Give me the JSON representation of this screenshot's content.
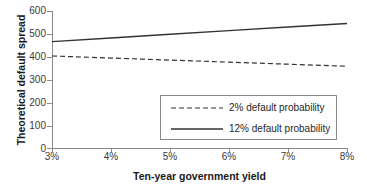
{
  "chart_data": {
    "type": "line",
    "title": "",
    "xlabel": "Ten-year government yield",
    "ylabel": "Theoretical default spread",
    "x": [
      3,
      4,
      5,
      6,
      7,
      8
    ],
    "xticklabels": [
      "3%",
      "4%",
      "5%",
      "6%",
      "7%",
      "8%"
    ],
    "yticklabels": [
      "0",
      "100",
      "200",
      "300",
      "400",
      "500",
      "600"
    ],
    "yticks": [
      0,
      100,
      200,
      300,
      400,
      500,
      600
    ],
    "xlim": [
      3,
      8
    ],
    "ylim": [
      0,
      600
    ],
    "grid": false,
    "legend_position": "center-right-inside",
    "series": [
      {
        "name": "2% default probability",
        "style": "dashed",
        "color": "#333333",
        "values": [
          403,
          394,
          385,
          376,
          367,
          358
        ]
      },
      {
        "name": "12% default probability",
        "style": "solid",
        "color": "#333333",
        "values": [
          466,
          482,
          498,
          514,
          530,
          545
        ]
      }
    ]
  },
  "axes": {
    "ylabel": "Theoretical default spread",
    "xlabel": "Ten-year government yield"
  },
  "legend": {
    "entries": [
      {
        "label": "2% default probability",
        "style": "dashed"
      },
      {
        "label": "12% default probability",
        "style": "solid"
      }
    ]
  },
  "colors": {
    "line": "#333333",
    "axis": "#8a8a8a",
    "text": "#1a1a1a",
    "tick_text": "#3a3a3a",
    "background": "#ffffff"
  }
}
